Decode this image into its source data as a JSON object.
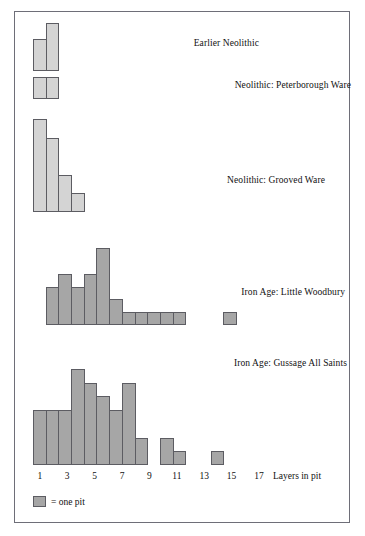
{
  "figure": {
    "axis_title": "Layers in pit",
    "legend": {
      "label": "= one pit",
      "swatch_color": "#a6a6a6"
    },
    "x_ticks": [
      "1",
      "3",
      "5",
      "7",
      "9",
      "11",
      "13",
      "15",
      "17"
    ],
    "colors": {
      "neolithic_fill": "#d4d4d4",
      "iron_age_fill": "#a6a6a6",
      "bar_stroke": "#5c5c62",
      "axis_line": "#4a4a52",
      "frame_border": "#6e6e78",
      "text": "#111111"
    }
  },
  "chart_data": {
    "type": "bar",
    "xlabel": "Layers in pit",
    "ylabel": "Number of pits",
    "x": [
      1,
      2,
      3,
      4,
      5,
      6,
      7,
      8,
      9,
      10,
      11,
      12,
      13,
      14,
      15,
      16,
      17
    ],
    "xlim": [
      1,
      17.5
    ],
    "x_tick_labels": [
      "1",
      "3",
      "5",
      "7",
      "9",
      "11",
      "13",
      "15",
      "17"
    ],
    "grid": false,
    "legend_position": "bottom-left",
    "legend_note": "each unit of bar height = one pit",
    "panels": [
      {
        "name": "Earlier Neolithic",
        "label": "Earlier Neolithic",
        "fill": "#d4d4d4",
        "ylim": [
          0,
          3
        ],
        "categories": [
          1,
          2
        ],
        "values": [
          2,
          3
        ]
      },
      {
        "name": "Neolithic: Peterborough Ware",
        "label": "Neolithic: Peterborough Ware",
        "fill": "#d4d4d4",
        "ylim": [
          0,
          1
        ],
        "categories": [
          1,
          2
        ],
        "values": [
          1,
          1
        ]
      },
      {
        "name": "Neolithic: Grooved Ware",
        "label": "Neolithic: Grooved Ware",
        "fill": "#d4d4d4",
        "ylim": [
          0,
          5
        ],
        "categories": [
          1,
          2,
          3,
          4
        ],
        "values": [
          5,
          4,
          2,
          1
        ]
      },
      {
        "name": "Iron Age: Little Woodbury",
        "label": "Iron Age: Little Woodbury",
        "fill": "#a6a6a6",
        "ylim": [
          0,
          6
        ],
        "categories": [
          2,
          3,
          4,
          5,
          6,
          7,
          8,
          9,
          10,
          11,
          12,
          16
        ],
        "values": [
          3,
          4,
          3,
          4,
          6,
          2,
          1,
          1,
          1,
          1,
          1,
          1
        ]
      },
      {
        "name": "Iron Age: Gussage All Saints",
        "label": "Iron Age: Gussage All Saints",
        "fill": "#a6a6a6",
        "ylim": [
          0,
          7
        ],
        "categories": [
          1,
          2,
          3,
          4,
          5,
          6,
          7,
          8,
          9,
          11,
          12,
          15
        ],
        "values": [
          4,
          4,
          4,
          7,
          6,
          5,
          4,
          6,
          2,
          2,
          1,
          1
        ]
      }
    ]
  }
}
